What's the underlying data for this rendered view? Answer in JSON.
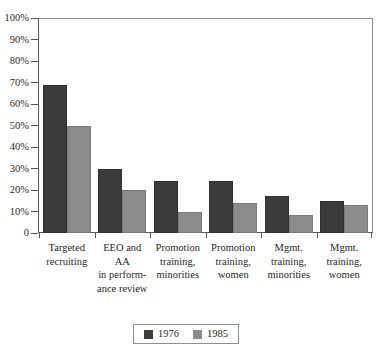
{
  "chart_data": {
    "type": "bar",
    "title": "",
    "subtitle": "",
    "xlabel": "",
    "ylabel": "",
    "ylim": [
      0,
      100
    ],
    "yticks": [
      0,
      10,
      20,
      30,
      40,
      50,
      60,
      70,
      80,
      90,
      100
    ],
    "ytick_labels": [
      "0",
      "10%",
      "20%",
      "30%",
      "40%",
      "50%",
      "60%",
      "70%",
      "80%",
      "90%",
      "100%"
    ],
    "grid": false,
    "legend_position": "bottom",
    "categories": [
      "Targeted recruiting",
      "EEO and AA in perform- ance review",
      "Promotion training, minorities",
      "Promotion training, women",
      "Mgmt. training, minorities",
      "Mgmt. training, women"
    ],
    "category_lines": [
      [
        "Targeted",
        "recruiting"
      ],
      [
        "EEO and AA",
        "in perform-",
        "ance review"
      ],
      [
        "Promotion",
        "training,",
        "minorities"
      ],
      [
        "Promotion",
        "training,",
        "women"
      ],
      [
        "Mgmt.",
        "training,",
        "minorities"
      ],
      [
        "Mgmt.",
        "training,",
        "women"
      ]
    ],
    "series": [
      {
        "name": "1976",
        "color": "#3b3b3b",
        "values": [
          69,
          30,
          24,
          24,
          17,
          15
        ]
      },
      {
        "name": "1985",
        "color": "#8b8b8b",
        "values": [
          50,
          20,
          10,
          14,
          8.5,
          13
        ]
      }
    ]
  },
  "legend": {
    "entries": [
      {
        "label": "1976",
        "color": "#3b3b3b"
      },
      {
        "label": "1985",
        "color": "#8b8b8b"
      }
    ]
  }
}
